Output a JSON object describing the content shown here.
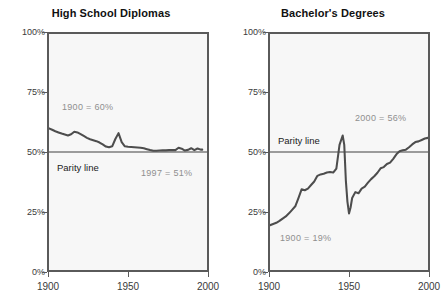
{
  "figure": {
    "width": 444,
    "height": 308,
    "background": "#ffffff",
    "series_color": "#4d4d4d",
    "parity_color": "#9b9b9b",
    "axis_color": "#5a5a5a",
    "plot_background": "#f7f7f7",
    "annotation_color": "#8f8f8f"
  },
  "panels": [
    {
      "id": "high-school-diplomas",
      "title": "High School Diplomas",
      "parity_label": "Parity line",
      "y_ticks": [
        "0%",
        "25%",
        "50%",
        "75%",
        "100%"
      ],
      "x_ticks": [
        "1900",
        "1950",
        "2000"
      ],
      "annotations": [
        {
          "text": "1900 = 60%",
          "x_year": 1908,
          "y_pct": 69
        },
        {
          "text": "1997 = 51%",
          "x_year": 1965,
          "y_pct": 42
        }
      ]
    },
    {
      "id": "bachelors-degrees",
      "title": "Bachelor's Degrees",
      "parity_label": "Parity line",
      "y_ticks": [
        "0%",
        "25%",
        "50%",
        "75%",
        "100%"
      ],
      "x_ticks": [
        "1900",
        "1950",
        "2000"
      ],
      "annotations": [
        {
          "text": "2000 = 56%",
          "x_year": 1967,
          "y_pct": 64
        },
        {
          "text": "1900 = 19%",
          "x_year": 1906,
          "y_pct": 14
        }
      ]
    }
  ],
  "chart_data": [
    {
      "type": "line",
      "title": "High School Diplomas",
      "xlabel": "",
      "ylabel": "",
      "xlim": [
        1900,
        2000
      ],
      "ylim": [
        0,
        100
      ],
      "y_tick_values": [
        0,
        25,
        50,
        75,
        100
      ],
      "y_tick_labels": [
        "0%",
        "25%",
        "50%",
        "75%",
        "100%"
      ],
      "x_tick_values": [
        1900,
        1950,
        2000
      ],
      "x_tick_labels": [
        "1900",
        "1950",
        "2000"
      ],
      "grid": false,
      "legend": "none",
      "reference_lines": [
        {
          "name": "Parity line",
          "y": 50,
          "label": "Parity line",
          "color": "#9b9b9b"
        }
      ],
      "annotations": [
        {
          "text": "1900 = 60%",
          "x": 1908,
          "y": 69
        },
        {
          "text": "1997 = 51%",
          "x": 1965,
          "y": 42
        }
      ],
      "series": [
        {
          "name": "Share of high school diplomas earned by females",
          "color": "#4d4d4d",
          "x": [
            1900,
            1902,
            1904,
            1906,
            1908,
            1910,
            1912,
            1914,
            1916,
            1918,
            1920,
            1922,
            1924,
            1926,
            1928,
            1930,
            1932,
            1934,
            1936,
            1938,
            1940,
            1942,
            1944,
            1946,
            1948,
            1950,
            1952,
            1954,
            1956,
            1958,
            1960,
            1962,
            1964,
            1966,
            1968,
            1970,
            1972,
            1974,
            1976,
            1978,
            1980,
            1982,
            1984,
            1986,
            1988,
            1990,
            1992,
            1994,
            1996,
            1997
          ],
          "y": [
            60.0,
            59.4,
            58.8,
            58.3,
            57.8,
            57.4,
            57.0,
            57.5,
            58.6,
            58.3,
            57.6,
            56.8,
            56.0,
            55.4,
            55.0,
            54.6,
            54.0,
            53.2,
            52.3,
            52.0,
            52.4,
            55.5,
            58.0,
            54.2,
            52.4,
            52.2,
            52.1,
            52.0,
            51.9,
            51.8,
            51.6,
            51.2,
            50.8,
            50.5,
            50.5,
            50.6,
            50.7,
            50.7,
            50.8,
            50.8,
            50.8,
            51.8,
            51.4,
            50.6,
            50.9,
            51.6,
            50.8,
            51.5,
            51.0,
            51.0
          ]
        }
      ]
    },
    {
      "type": "line",
      "title": "Bachelor's Degrees",
      "xlabel": "",
      "ylabel": "",
      "xlim": [
        1900,
        2000
      ],
      "ylim": [
        0,
        100
      ],
      "y_tick_values": [
        0,
        25,
        50,
        75,
        100
      ],
      "y_tick_labels": [
        "0%",
        "25%",
        "50%",
        "75%",
        "100%"
      ],
      "x_tick_values": [
        1900,
        1950,
        2000
      ],
      "x_tick_labels": [
        "1900",
        "1950",
        "2000"
      ],
      "grid": false,
      "legend": "none",
      "reference_lines": [
        {
          "name": "Parity line",
          "y": 50,
          "label": "Parity line",
          "color": "#9b9b9b"
        }
      ],
      "annotations": [
        {
          "text": "2000 = 56%",
          "x": 1967,
          "y": 64
        },
        {
          "text": "1900 = 19%",
          "x": 1906,
          "y": 14
        }
      ],
      "series": [
        {
          "name": "Share of bachelor's degrees earned by females",
          "color": "#4d4d4d",
          "x": [
            1900,
            1902,
            1904,
            1906,
            1908,
            1910,
            1912,
            1914,
            1916,
            1918,
            1920,
            1922,
            1924,
            1926,
            1928,
            1930,
            1932,
            1934,
            1936,
            1938,
            1940,
            1942,
            1944,
            1946,
            1947,
            1948,
            1949,
            1950,
            1951,
            1952,
            1954,
            1956,
            1958,
            1960,
            1962,
            1964,
            1966,
            1968,
            1970,
            1972,
            1974,
            1976,
            1978,
            1980,
            1982,
            1984,
            1986,
            1988,
            1990,
            1992,
            1994,
            1996,
            1998,
            2000
          ],
          "y": [
            19.0,
            19.5,
            20.0,
            20.8,
            21.8,
            22.7,
            24.0,
            25.5,
            27.0,
            30.5,
            34.2,
            33.8,
            34.5,
            36.0,
            37.5,
            39.9,
            40.5,
            40.8,
            41.3,
            41.5,
            41.3,
            43.0,
            53.0,
            57.0,
            53.0,
            38.0,
            29.0,
            24.0,
            26.5,
            30.5,
            33.0,
            32.5,
            34.5,
            35.3,
            37.0,
            38.5,
            39.7,
            41.2,
            43.1,
            43.6,
            44.9,
            45.5,
            47.1,
            49.0,
            50.3,
            50.7,
            51.0,
            52.0,
            53.2,
            54.2,
            54.5,
            55.1,
            55.7,
            56.0
          ]
        }
      ]
    }
  ]
}
